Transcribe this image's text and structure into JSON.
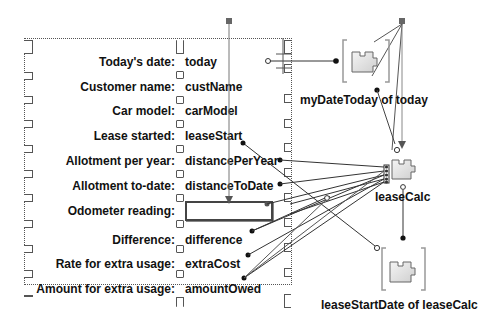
{
  "form": {
    "fields": [
      {
        "label": "Today's date:",
        "value": "today"
      },
      {
        "label": "Customer name:",
        "value": "custName"
      },
      {
        "label": "Car model:",
        "value": "carModel"
      },
      {
        "label": "Lease started:",
        "value": "leaseStart"
      },
      {
        "label": "Allotment per year:",
        "value": "distancePerYear"
      },
      {
        "label": "Allotment to-date:",
        "value": "distanceToDate"
      },
      {
        "label": "Odometer reading:",
        "value": ""
      },
      {
        "label": "Difference:",
        "value": "difference"
      },
      {
        "label": "Rate for extra usage:",
        "value": "extraCost"
      },
      {
        "label": "Amount for extra usage:",
        "value": "amountOwed"
      }
    ]
  },
  "components": {
    "myDateToday": {
      "label": "myDateToday of today"
    },
    "leaseCalc": {
      "label": "leaseCalc"
    },
    "leaseStartDate": {
      "label": "leaseStartDate of leaseCalc"
    }
  },
  "colors": {
    "line": "#333333",
    "frame": "#555555",
    "component_fill": "#e6e6e6",
    "bracket": "#999999"
  }
}
